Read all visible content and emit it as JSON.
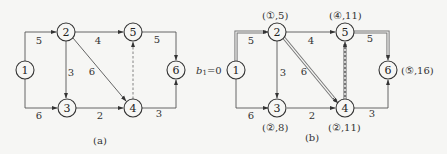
{
  "diagrams": [
    {
      "caption": "(a)",
      "nodes": [
        {
          "id": "1",
          "label": "1"
        },
        {
          "id": "2",
          "label": "2"
        },
        {
          "id": "3",
          "label": "3"
        },
        {
          "id": "4",
          "label": "4"
        },
        {
          "id": "5",
          "label": "5"
        },
        {
          "id": "6",
          "label": "6"
        }
      ],
      "edges": [
        {
          "from": "1",
          "to": "2",
          "weight": "5"
        },
        {
          "from": "1",
          "to": "3",
          "weight": "6"
        },
        {
          "from": "2",
          "to": "5",
          "weight": "4"
        },
        {
          "from": "2",
          "to": "3",
          "weight": "3"
        },
        {
          "from": "2",
          "to": "4",
          "weight": "6"
        },
        {
          "from": "3",
          "to": "4",
          "weight": "2"
        },
        {
          "from": "4",
          "to": "5",
          "weight": "",
          "style": "dashed"
        },
        {
          "from": "5",
          "to": "6",
          "weight": "5"
        },
        {
          "from": "4",
          "to": "6",
          "weight": "3"
        }
      ]
    },
    {
      "caption": "(b)",
      "start_label": "b₁ = 0",
      "start_label_parts": {
        "b": "b",
        "sub": "1",
        "eq": "=0"
      },
      "nodes": [
        {
          "id": "1",
          "label": "1"
        },
        {
          "id": "2",
          "label": "2",
          "mark": "(①,5)"
        },
        {
          "id": "3",
          "label": "3",
          "mark": "(②,8)"
        },
        {
          "id": "4",
          "label": "4",
          "mark": "(②,11)"
        },
        {
          "id": "5",
          "label": "5",
          "mark": "(④,11)"
        },
        {
          "id": "6",
          "label": "6",
          "mark": "(⑤,16)"
        }
      ],
      "edges": [
        {
          "from": "1",
          "to": "2",
          "weight": "5",
          "highlighted": true
        },
        {
          "from": "1",
          "to": "3",
          "weight": "6"
        },
        {
          "from": "2",
          "to": "5",
          "weight": "4"
        },
        {
          "from": "2",
          "to": "3",
          "weight": "3"
        },
        {
          "from": "2",
          "to": "4",
          "weight": "6",
          "highlighted": true
        },
        {
          "from": "3",
          "to": "4",
          "weight": "2"
        },
        {
          "from": "4",
          "to": "5",
          "weight": "",
          "style": "dashed",
          "highlighted": true
        },
        {
          "from": "5",
          "to": "6",
          "weight": "5",
          "highlighted": true
        },
        {
          "from": "4",
          "to": "6",
          "weight": "3"
        }
      ]
    }
  ]
}
